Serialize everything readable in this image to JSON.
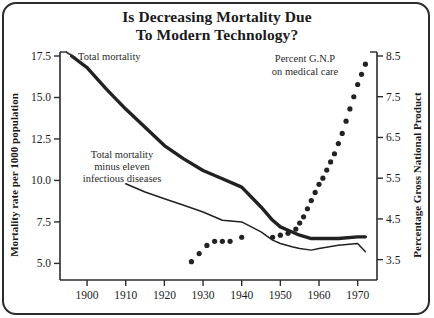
{
  "title": {
    "line1": "Is Decreasing Mortality Due",
    "line2": "To Modern Technology?"
  },
  "axes": {
    "left_title": "Mortality rate per 1000 population",
    "right_title": "Percentage Gross National Product",
    "left_ticks": [
      "5.0",
      "7.5",
      "10.0",
      "12.5",
      "15.0",
      "17.5"
    ],
    "right_ticks": [
      "3.5",
      "4.5",
      "5.5",
      "6.5",
      "7.5",
      "8.5"
    ],
    "x_ticks": [
      "1900",
      "1910",
      "1920",
      "1930",
      "1940",
      "1950",
      "1960",
      "1970"
    ]
  },
  "annotations": {
    "total_mortality": "Total mortality",
    "minus_infectious_l1": "Total mortality",
    "minus_infectious_l2": "minus eleven",
    "minus_infectious_l3": "infectious diseases",
    "gnp_l1": "Percent G.N.P",
    "gnp_l2": "on medical care"
  },
  "chart_data": {
    "type": "line",
    "title": "Is Decreasing Mortality Due To Modern Technology?",
    "xlabel": "",
    "ylabel": "Mortality rate per 1000 population",
    "ylabel_right": "Percentage Gross National Product",
    "xlim": [
      1893,
      1975
    ],
    "ylim": [
      4.0,
      17.5
    ],
    "ylim_right": [
      3.0,
      8.5
    ],
    "grid": false,
    "legend": "annotations on plot",
    "series": [
      {
        "name": "Total mortality",
        "type": "line",
        "style": "thick solid",
        "axis": "left",
        "color": "#212121",
        "x": [
          1896,
          1900,
          1905,
          1910,
          1915,
          1920,
          1925,
          1930,
          1935,
          1940,
          1945,
          1948,
          1950,
          1952,
          1955,
          1958,
          1960,
          1965,
          1970,
          1972
        ],
        "values": [
          17.5,
          16.8,
          15.5,
          14.3,
          13.2,
          12.1,
          11.3,
          10.6,
          10.1,
          9.6,
          8.4,
          7.6,
          7.2,
          7.0,
          6.7,
          6.5,
          6.5,
          6.5,
          6.6,
          6.6
        ]
      },
      {
        "name": "Total mortality minus eleven infectious diseases",
        "type": "line",
        "style": "thin solid",
        "axis": "left",
        "color": "#212121",
        "x": [
          1910,
          1915,
          1920,
          1925,
          1930,
          1935,
          1940,
          1945,
          1948,
          1950,
          1953,
          1955,
          1958,
          1960,
          1965,
          1970,
          1972
        ],
        "values": [
          9.8,
          9.3,
          8.9,
          8.5,
          8.1,
          7.6,
          7.5,
          6.9,
          6.4,
          6.2,
          6.0,
          5.9,
          5.8,
          5.9,
          6.1,
          6.2,
          5.7
        ]
      },
      {
        "name": "Percent G.N.P on medical care",
        "type": "scatter",
        "style": "dotted",
        "axis": "right",
        "color": "#222222",
        "x": [
          1927,
          1929,
          1931,
          1933,
          1935,
          1937,
          1940,
          1948,
          1950,
          1952,
          1954,
          1955,
          1956,
          1957,
          1958,
          1959,
          1960,
          1961,
          1962,
          1963,
          1964,
          1965,
          1966,
          1967,
          1968,
          1969,
          1970,
          1971,
          1972
        ],
        "values": [
          3.45,
          3.65,
          3.85,
          3.95,
          3.95,
          3.95,
          4.05,
          4.05,
          4.1,
          4.15,
          4.25,
          4.4,
          4.55,
          4.75,
          4.95,
          5.15,
          5.35,
          5.5,
          5.7,
          5.9,
          6.1,
          6.35,
          6.6,
          6.9,
          7.2,
          7.5,
          7.8,
          8.05,
          8.3
        ]
      }
    ]
  }
}
